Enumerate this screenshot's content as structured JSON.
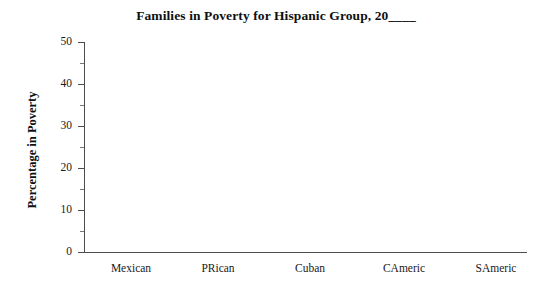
{
  "chart_data": {
    "type": "bar",
    "title": "Families in Poverty for Hispanic Group, 20____",
    "xlabel": "",
    "ylabel": "Percentage in Poverty",
    "categories": [
      "Mexican",
      "PRican",
      "Cuban",
      "CAmeric",
      "SAmeric"
    ],
    "values": [
      null,
      null,
      null,
      null,
      null
    ],
    "series": [
      {
        "name": "Percentage in Poverty",
        "values": [
          null,
          null,
          null,
          null,
          null
        ]
      }
    ],
    "ylim": [
      0,
      50
    ],
    "ytick_labels": [
      "0",
      "10",
      "20",
      "30",
      "40",
      "50"
    ],
    "ytick_values": [
      0,
      10,
      20,
      30,
      40,
      50
    ],
    "yminor_step": 5,
    "grid": false,
    "legend": false,
    "legend_position": "none",
    "note": "blank worksheet template - no bars plotted",
    "colors": {
      "background": "#ffffff",
      "axis": "#4d4d4d",
      "text": "#1a1a1a",
      "title": "#101010"
    }
  }
}
